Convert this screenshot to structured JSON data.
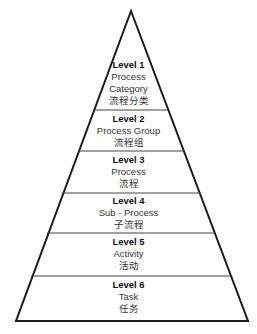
{
  "diagram": {
    "type": "pyramid",
    "line_color": "#1a1a1a",
    "levels": [
      {
        "level": "Level 1",
        "english": "Process",
        "english2": "Category",
        "chinese": "流程分类"
      },
      {
        "level": "Level 2",
        "english": "Process Group",
        "chinese": "流程组"
      },
      {
        "level": "Level 3",
        "english": "Process",
        "chinese": "流程"
      },
      {
        "level": "Level 4",
        "english": "Sub - Process",
        "chinese": "子流程"
      },
      {
        "level": "Level 5",
        "english": "Activity",
        "chinese": "活动"
      },
      {
        "level": "Level 6",
        "english": "Task",
        "chinese": "任务"
      }
    ]
  }
}
